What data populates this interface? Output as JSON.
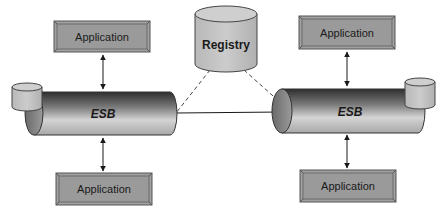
{
  "diagram": {
    "registry": {
      "label": "Registry"
    },
    "left": {
      "app_top": {
        "label": "Application"
      },
      "esb": {
        "label": "ESB"
      },
      "app_bottom": {
        "label": "Application"
      }
    },
    "right": {
      "app_top": {
        "label": "Application"
      },
      "esb": {
        "label": "ESB"
      },
      "app_bottom": {
        "label": "Application"
      }
    },
    "connections": [
      {
        "from": "left.app_top",
        "to": "left.esb",
        "style": "double-arrow"
      },
      {
        "from": "left.esb",
        "to": "left.app_bottom",
        "style": "double-arrow"
      },
      {
        "from": "right.app_top",
        "to": "right.esb",
        "style": "double-arrow"
      },
      {
        "from": "right.esb",
        "to": "right.app_bottom",
        "style": "double-arrow"
      },
      {
        "from": "left.esb",
        "to": "right.esb",
        "style": "solid"
      },
      {
        "from": "registry",
        "to": "left.esb",
        "style": "dashed"
      },
      {
        "from": "registry",
        "to": "right.esb",
        "style": "dashed"
      }
    ],
    "colors": {
      "app_fill": "#9c9c9c",
      "app_border": "#5a5a5a",
      "cylinder_fill": "#c4c4c4",
      "tube_dark": "#3a3a3a",
      "tube_light": "#d8d8d8",
      "line": "#2a2a2a"
    }
  }
}
